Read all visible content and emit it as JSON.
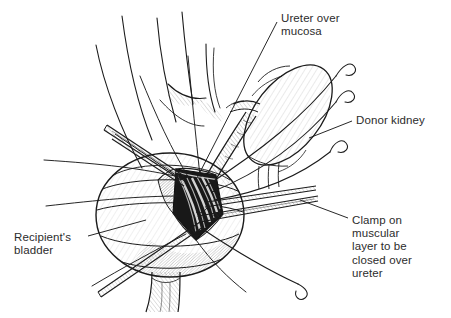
{
  "figure": {
    "domain": "medical-illustration",
    "style": "black-and-white pen-and-ink line drawing with hatched shading",
    "background_color": "#ffffff",
    "ink_color": "#1b1b1b",
    "text_color": "#2c2c2c"
  },
  "annotations": [
    {
      "id": "ureter-over-mucosa",
      "lines": [
        "Ureter over",
        "mucosa"
      ],
      "text": "Ureter over mucosa",
      "position": "top-center-right",
      "leader": "diagonal line down-left to bladder incision"
    },
    {
      "id": "donor-kidney",
      "lines": [
        "Donor kidney"
      ],
      "text": "Donor kidney",
      "position": "right-upper",
      "leader": "short diagonal line up-left to kidney body"
    },
    {
      "id": "clamp-on-muscular-layer",
      "lines": [
        "Clamp on",
        "muscular",
        "layer to be",
        "closed over",
        "ureter"
      ],
      "text": "Clamp on muscular layer to be closed over ureter",
      "position": "right-lower",
      "leader": "short diagonal line up-left to clamp tip"
    },
    {
      "id": "recipients-bladder",
      "lines": [
        "Recipient's",
        "bladder"
      ],
      "text": "Recipient's bladder",
      "position": "left-lower",
      "leader": "diagonal line up-right to bladder wall"
    }
  ],
  "anatomy": [
    {
      "name": "recipient-bladder",
      "description": "large ovoid hollow organ, center-left, with curved banding lines and fine hatched shading"
    },
    {
      "name": "bladder-neck",
      "description": "short tapered urethral stub descending from bladder base"
    },
    {
      "name": "bladder-incision",
      "description": "dark lens-shaped detrusor incision at upper-right of bladder exposing mucosa"
    },
    {
      "name": "donor-kidney",
      "description": "bean-shaped organ tilted diagonally at upper right"
    },
    {
      "name": "donor-ureter",
      "description": "tube descending from kidney hilum down-left into bladder incision, laid over mucosa"
    },
    {
      "name": "renal-vessels",
      "description": "vessels at kidney hilum drawn as short tapering tubes"
    },
    {
      "name": "retracted-tissue-edges",
      "description": "long sweeping curved lines fanning upward above the bladder"
    }
  ],
  "instruments": [
    {
      "name": "upper-left-forceps",
      "description": "long tapered two-bladed instrument entering from upper left into incision"
    },
    {
      "name": "clamp",
      "description": "long thin tapered clamp on muscular layer, pointing right from the incision"
    },
    {
      "name": "lower-left-forceps",
      "description": "long tapered instrument exiting toward lower left"
    },
    {
      "name": "suture-needle-1",
      "description": "curved needle with hook tip, upper right"
    },
    {
      "name": "suture-needle-2",
      "description": "curved needle with hook tip, upper right below first"
    },
    {
      "name": "suture-needle-3",
      "description": "curved needle with hook tip, middle right"
    },
    {
      "name": "suture-needle-4",
      "description": "long suture curving to lower right ending in hook needle"
    }
  ]
}
